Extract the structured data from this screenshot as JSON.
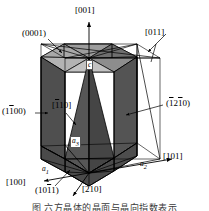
{
  "figure": {
    "type": "crystallographic-diagram",
    "background_color": "#ffffff",
    "line_color": "#000000",
    "shade_dark": "#4a4a4a",
    "shade_medium": "#6e6e6e",
    "shade_light": "#b8b8b8"
  },
  "labels": {
    "axis_c": "[001]",
    "axis_a2_dir": "[101]",
    "axis_a1_dir": "[100]",
    "dir_210": "[210]",
    "dir_011": "[011]",
    "dir_110": "[<span class='ovb'>1</span>10]",
    "plane_basal": "(0001)",
    "plane_prism_left": "(1<span class='ovb'>1</span>00)",
    "plane_prism_right": "(<span class='ovb'>1</span>2<span class='ovb'>1</span>0)",
    "plane_pyramidal": "(10<span class='ovb'>1</span>1)",
    "vertex_c": "c",
    "axis_a1": "a<sub>1</sub>",
    "axis_a2": "a<sub>2</sub>",
    "axis_a3": "a<sub>3</sub>"
  },
  "caption": {
    "text": "图   六方晶体的晶面与晶向指数表示"
  },
  "indices": {
    "planes": [
      "(0001)",
      "(1-100)",
      "(-12-10)",
      "(10-11)"
    ],
    "directions": [
      "[001]",
      "[100]",
      "[101]",
      "[210]",
      "[011]",
      "[-110]"
    ],
    "axes": [
      "a1",
      "a2",
      "a3",
      "c"
    ]
  }
}
